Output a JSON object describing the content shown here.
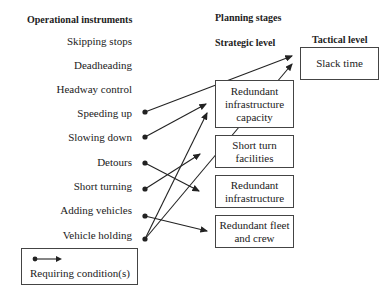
{
  "headers": {
    "operational": "Operational instruments",
    "planning": "Planning stages",
    "strategic": "Strategic level",
    "tactical": "Tactical level"
  },
  "instruments": [
    "Skipping stops",
    "Deadheading",
    "Headway control",
    "Speeding up",
    "Slowing down",
    "Detours",
    "Short turning",
    "Adding vehicles",
    "Vehicle holding"
  ],
  "strategic_boxes": [
    "Redundant infrastructure capacity",
    "Short turn facilities",
    "Redundant infrastructure",
    "Redundant fleet and crew"
  ],
  "tactical_boxes": [
    "Slack time"
  ],
  "connections": [
    {
      "from": "Speeding up",
      "to": "Slack time"
    },
    {
      "from": "Slowing down",
      "to": "Redundant infrastructure capacity"
    },
    {
      "from": "Detours",
      "to": "Redundant infrastructure"
    },
    {
      "from": "Short turning",
      "to": "Short turn facilities"
    },
    {
      "from": "Adding vehicles",
      "to": "Redundant fleet and crew"
    },
    {
      "from": "Vehicle holding",
      "to": "Redundant infrastructure capacity"
    },
    {
      "from": "Vehicle holding",
      "to": "Slack time"
    }
  ],
  "legend": {
    "label": "Requiring condition(s)"
  }
}
